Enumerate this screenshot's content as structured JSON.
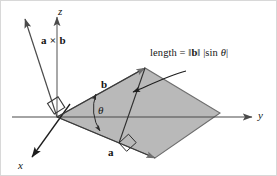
{
  "figure": {
    "name": "cross-product-parallelogram-diagram",
    "background_color": "#ffffff",
    "ink_color": "#141414",
    "axis_color": "#4a4a4a",
    "parallelogram_fill": "#b9b9b9",
    "parallelogram_stroke": "#6e6e6e",
    "border_color": "#cfcfcf"
  },
  "axes": {
    "z_label": "z",
    "y_label": "y",
    "x_label": "x"
  },
  "vectors": {
    "cross_label": "a × b",
    "b_label": "b",
    "a_label": "a"
  },
  "angle": {
    "theta_label": "θ"
  },
  "annotation": {
    "prefix": "length = ",
    "norm_open": "‖",
    "norm_vector": "b",
    "norm_close": "‖",
    "abs_open": "|",
    "sin_text": "sin ",
    "sin_theta": "θ",
    "abs_close": "|",
    "full_text": "length = ‖b‖ |sin θ|"
  },
  "marks": {
    "right_angle_origin": "right-angle-mark",
    "right_angle_altitude": "right-angle-mark"
  }
}
